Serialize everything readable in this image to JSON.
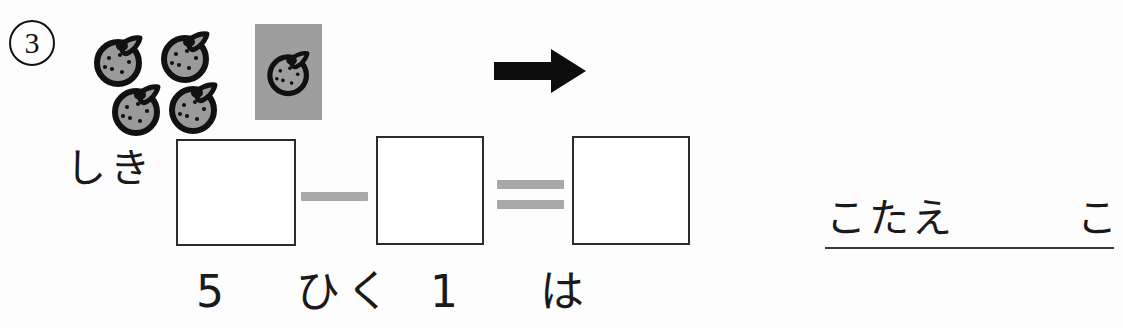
{
  "worksheet": {
    "problem_number": "3",
    "shiki_label": "しき",
    "kotae_label": "こたえ",
    "kotae_unit": "こ",
    "equation_reading": {
      "minuend": "5",
      "operator_word": "ひく",
      "subtrahend": "1",
      "copula": "は"
    },
    "operators": {
      "minus": "−",
      "equals": "="
    },
    "arrow": "right-arrow",
    "boxes": [
      {
        "name": "minuend-box",
        "value": ""
      },
      {
        "name": "subtrahend-box",
        "value": ""
      },
      {
        "name": "result-box",
        "value": ""
      }
    ],
    "fruit": {
      "name": "mikan",
      "group_count": 4,
      "removed_count": 1,
      "total_count": 5,
      "fill_color": "#9a9a9a",
      "outline_color": "#111111",
      "highlight_color": "#9e9e9e"
    },
    "colors": {
      "background": "#fdfdfd",
      "ink": "#1a1a1a",
      "operator_gray": "#a8a8a8",
      "box_border": "#2b2b2b"
    }
  }
}
